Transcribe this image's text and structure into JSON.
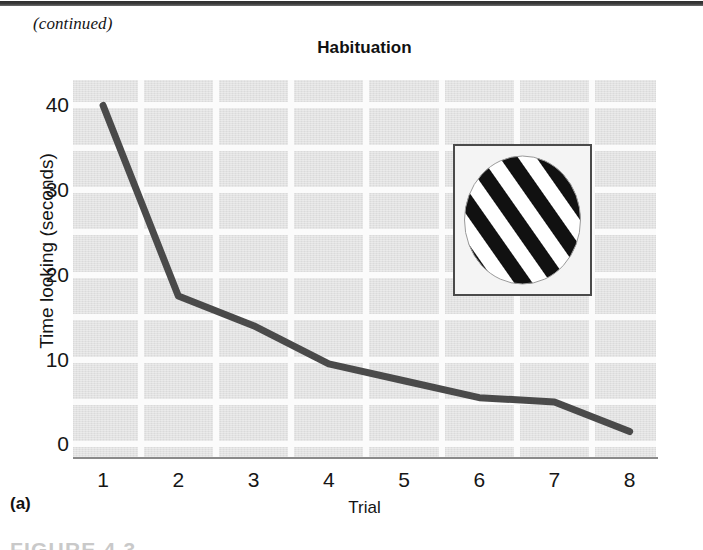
{
  "page": {
    "continued_label": "(continued)",
    "panel_letter": "(a)",
    "figure_caption_partial": "FIGURE 4.3"
  },
  "colors": {
    "plot_background": "#e2e2e2",
    "gridline": "#fbfbfb",
    "series_line": "#4a4a4a",
    "axis": "#8a8a8a",
    "text": "#161616",
    "stimulus_stripe": "#111111"
  },
  "chart_data": {
    "type": "line",
    "title": "Habituation",
    "xlabel": "Trial",
    "ylabel": "Time looking (seconds)",
    "x": [
      1,
      2,
      3,
      4,
      5,
      6,
      7,
      8
    ],
    "xticklabels": [
      "1",
      "2",
      "3",
      "4",
      "5",
      "6",
      "7",
      "8"
    ],
    "values": [
      40,
      17.5,
      14,
      9.5,
      7.5,
      5.5,
      5,
      1.5
    ],
    "yticks": [
      0,
      10,
      20,
      30,
      40
    ],
    "yticklabels": [
      "0",
      "10",
      "20",
      "30",
      "40"
    ],
    "xlim": [
      0.6,
      8.35
    ],
    "ylim": [
      -1.5,
      43
    ],
    "grid": true,
    "grid_y_minor_step": 5,
    "legend": null,
    "series": [
      {
        "name": "Time looking",
        "values": [
          40,
          17.5,
          14,
          9.5,
          7.5,
          5.5,
          5,
          1.5
        ]
      }
    ],
    "annotations": [
      {
        "name": "habituation-stimulus",
        "kind": "image-inset",
        "description": "Square frame containing a circle filled with diagonal black and white stripes"
      }
    ]
  }
}
